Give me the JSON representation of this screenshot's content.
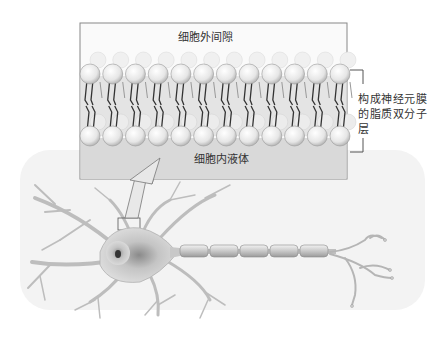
{
  "figure": {
    "type": "neuron membrane lipid bilayer illustration",
    "labels": {
      "extracellular_space": "细胞外间隙",
      "intracellular_fluid": "细胞内液体",
      "bilayer_caption": "构成神经元膜的脂质双分子层"
    },
    "components": [
      "neuron-cell-body",
      "nucleus",
      "dendrites",
      "myelinated-axon",
      "axon-terminals",
      "zoom-region-box",
      "magnify-arrow",
      "lipid-bilayer-inset",
      "bilayer-bracket"
    ],
    "bilayer": {
      "head_count_per_row": 12
    },
    "axon": {
      "myelin_segments": 5
    },
    "colors": {
      "head_fill": "#eeeeee",
      "tail_color": "#333333",
      "intracellular_fill": "#d9d9d9",
      "neuron_fill": "#dcdcdc",
      "background_shade": "#f0f0f0"
    }
  }
}
